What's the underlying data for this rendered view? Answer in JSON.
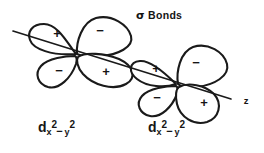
{
  "figure": {
    "title": "σ Bonds",
    "title_symbol": "σ",
    "title_word": "Bonds",
    "background_color": "#ffffff",
    "stroke_color": "#1a1a1a",
    "type": "orbital-overlap-diagram"
  },
  "axis": {
    "label": "z",
    "start_x": 13,
    "start_y": 31,
    "end_x": 231,
    "end_y": 99,
    "label_x": 246,
    "label_y": 101
  },
  "orbitals": [
    {
      "name": "left-orbital",
      "label_d": "d",
      "label_sub1": "x",
      "label_sup1": "2",
      "label_minus": "−",
      "label_sub2": "y",
      "label_sup2": "2",
      "center_x": 76,
      "center_y": 55,
      "lobes": [
        {
          "position": "upper-left",
          "sign": "+",
          "sign_x": 57,
          "sign_y": 35
        },
        {
          "position": "upper-right",
          "sign": "−",
          "sign_x": 100,
          "sign_y": 32
        },
        {
          "position": "lower-left",
          "sign": "−",
          "sign_x": 59,
          "sign_y": 72
        },
        {
          "position": "lower-right",
          "sign": "+",
          "sign_x": 106,
          "sign_y": 73
        }
      ]
    },
    {
      "name": "right-orbital",
      "label_d": "d",
      "label_sub1": "x",
      "label_sup1": "2",
      "label_minus": "−",
      "label_sub2": "y",
      "label_sup2": "2",
      "center_x": 177,
      "center_y": 85,
      "lobes": [
        {
          "position": "upper-left",
          "sign": "+",
          "sign_x": 156,
          "sign_y": 70
        },
        {
          "position": "upper-right",
          "sign": "−",
          "sign_x": 196,
          "sign_y": 64
        },
        {
          "position": "lower-left",
          "sign": "−",
          "sign_x": 157,
          "sign_y": 99
        },
        {
          "position": "lower-right",
          "sign": "+",
          "sign_x": 204,
          "sign_y": 104
        }
      ]
    }
  ]
}
